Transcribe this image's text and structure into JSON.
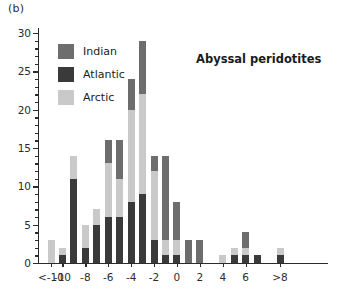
{
  "panel_label": "(b)",
  "chart_data": {
    "type": "bar",
    "subtype": "stacked-histogram",
    "title": "Abyssal peridotites",
    "xlabel": "",
    "ylabel": "",
    "ylim": [
      0,
      30
    ],
    "ytick_step": 5,
    "yminor_step": 1,
    "ytick_labels": [
      "0",
      "5",
      "10",
      "15",
      "20",
      "25",
      "30"
    ],
    "ytick_values": [
      0,
      5,
      10,
      15,
      20,
      25,
      30
    ],
    "grid": false,
    "legend_position": "upper-left",
    "xtick_labels": [
      "<-10",
      "-10",
      "-8",
      "-6",
      "-4",
      "-2",
      "0",
      "2",
      "4",
      "6",
      ">8"
    ],
    "xtick_values": [
      -11,
      -10,
      -8,
      -6,
      -4,
      -2,
      0,
      2,
      4,
      6,
      9
    ],
    "categories": [
      -11,
      -10,
      -9,
      -8,
      -7,
      -6,
      -5,
      -4,
      -3,
      -2,
      -1,
      0,
      1,
      2,
      3,
      4,
      5,
      6,
      7,
      8,
      9
    ],
    "series": [
      {
        "name": "Atlantic",
        "color": "#3a3a3a",
        "values": [
          0,
          1,
          11,
          2,
          5,
          6,
          6,
          8,
          9,
          3,
          1,
          1,
          0,
          0,
          0,
          0,
          1,
          1,
          1,
          0,
          1
        ]
      },
      {
        "name": "Arctic",
        "color": "#c9c9c9",
        "values": [
          3,
          1,
          3,
          3,
          2,
          7,
          5,
          12,
          13,
          9,
          2,
          2,
          0,
          0,
          0,
          1,
          1,
          1,
          0,
          0,
          1
        ]
      },
      {
        "name": "Indian",
        "color": "#6d6d6d",
        "values": [
          0,
          0,
          0,
          0,
          0,
          3,
          5,
          4,
          7,
          2,
          11,
          5,
          3,
          3,
          0,
          0,
          0,
          2,
          0,
          0,
          0
        ]
      }
    ],
    "totals": [
      3,
      2,
      14,
      5,
      7,
      16,
      16,
      24,
      29,
      14,
      14,
      8,
      3,
      3,
      0,
      1,
      2,
      4,
      1,
      0,
      2
    ]
  },
  "legend": {
    "items": [
      {
        "label": "Indian",
        "color": "#6d6d6d"
      },
      {
        "label": "Atlantic",
        "color": "#3a3a3a"
      },
      {
        "label": "Arctic",
        "color": "#c9c9c9"
      }
    ]
  }
}
